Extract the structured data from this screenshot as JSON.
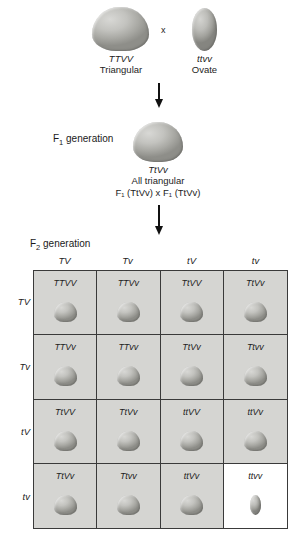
{
  "parents": {
    "left": {
      "genotype": "TTVV",
      "phenotype": "Triangular",
      "seed_shape": "triangular"
    },
    "cross_symbol": "x",
    "right": {
      "genotype": "ttvv",
      "phenotype": "Ovate",
      "seed_shape": "ovate"
    }
  },
  "f1": {
    "generation_label_main": "F",
    "generation_label_sub": "1",
    "generation_label_tail": " generation",
    "genotype": "TtVv",
    "phenotype": "All triangular",
    "self_cross": "F₁ (TtVv)  x  F₁ (TtVv)",
    "seed_shape": "triangular"
  },
  "f2": {
    "generation_label_main": "F",
    "generation_label_sub": "2",
    "generation_label_tail": " generation",
    "column_headers": [
      "TV",
      "Tv",
      "tV",
      "tv"
    ],
    "row_headers": [
      "TV",
      "Tv",
      "tV",
      "tv"
    ],
    "cells": [
      [
        {
          "genotype": "TTVV",
          "seed": "triangular",
          "background": "gray"
        },
        {
          "genotype": "TTVv",
          "seed": "triangular",
          "background": "gray"
        },
        {
          "genotype": "TtVV",
          "seed": "triangular",
          "background": "gray"
        },
        {
          "genotype": "TtVv",
          "seed": "triangular",
          "background": "gray"
        }
      ],
      [
        {
          "genotype": "TTVv",
          "seed": "triangular",
          "background": "gray"
        },
        {
          "genotype": "TTvv",
          "seed": "triangular",
          "background": "gray"
        },
        {
          "genotype": "TtVv",
          "seed": "triangular",
          "background": "gray"
        },
        {
          "genotype": "Ttvv",
          "seed": "triangular",
          "background": "gray"
        }
      ],
      [
        {
          "genotype": "TtVV",
          "seed": "triangular",
          "background": "gray"
        },
        {
          "genotype": "TtVv",
          "seed": "triangular",
          "background": "gray"
        },
        {
          "genotype": "ttVV",
          "seed": "triangular",
          "background": "gray"
        },
        {
          "genotype": "ttVv",
          "seed": "triangular",
          "background": "gray"
        }
      ],
      [
        {
          "genotype": "TtVv",
          "seed": "triangular",
          "background": "gray"
        },
        {
          "genotype": "Ttvv",
          "seed": "triangular",
          "background": "gray"
        },
        {
          "genotype": "ttVv",
          "seed": "triangular",
          "background": "gray"
        },
        {
          "genotype": "ttvv",
          "seed": "ovate",
          "background": "white"
        }
      ]
    ]
  },
  "colors": {
    "cell_gray": "#d5d5d2",
    "cell_white": "#ffffff",
    "grid_line": "#3a3a3a",
    "seed_gray": "#b5b5b1",
    "text": "#1d1d1d"
  }
}
